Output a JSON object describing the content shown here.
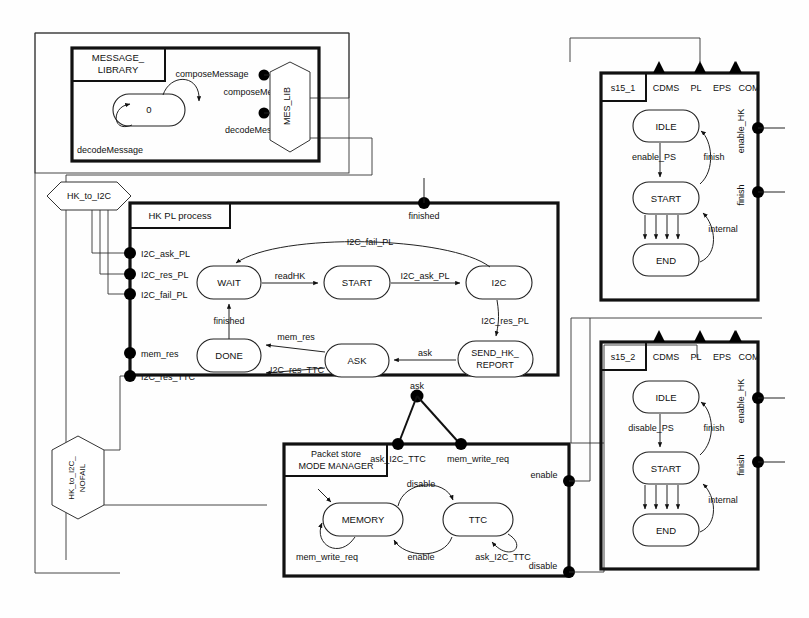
{
  "diagram": {
    "type": "state-machine",
    "colors": {
      "line": "#111111",
      "fill": "#ffffff",
      "node": "#000000"
    }
  },
  "message_library": {
    "block_title_line1": "MESSAGE_",
    "block_title_line2": "LIBRARY",
    "state": "0",
    "transitions": [
      {
        "label": "composeMessage",
        "kind": "self-loop-top"
      },
      {
        "label": "decodeMessage",
        "kind": "self-loop-bottom"
      }
    ],
    "port_labels": [
      "composeMessage",
      "decodeMessage"
    ],
    "gate": "MES_LIB"
  },
  "hk_pl_process": {
    "block_title": "HK PL process",
    "states": [
      "WAIT",
      "START",
      "I2C",
      "DONE",
      "ASK",
      "SEND_HK_\nREPORT"
    ],
    "state_labels": {
      "wait": "WAIT",
      "start": "START",
      "i2c": "I2C",
      "done": "DONE",
      "ask": "ASK",
      "send_hk_report_line1": "SEND_HK_",
      "send_hk_report_line2": "REPORT"
    },
    "transitions": [
      {
        "from": "WAIT",
        "to": "START",
        "label": "readHK"
      },
      {
        "from": "START",
        "to": "I2C",
        "label": "I2C_ask_PL"
      },
      {
        "from": "I2C",
        "to": "WAIT",
        "label": "I2C_fail_PL"
      },
      {
        "from": "I2C",
        "to": "SEND_HK_REPORT",
        "label": "I2C_res_PL"
      },
      {
        "from": "SEND_HK_REPORT",
        "to": "ASK",
        "label": "ask"
      },
      {
        "from": "ASK",
        "to": "DONE",
        "label": "mem_res"
      },
      {
        "from": "ASK",
        "to": "DONE",
        "label": "I2C_res_TTC"
      },
      {
        "from": "DONE",
        "to": "WAIT",
        "label": "finished"
      }
    ],
    "left_ports": [
      "I2C_ask_PL",
      "I2C_res_PL",
      "I2C_fail_PL",
      "mem_res",
      "I2C_res_TTC"
    ],
    "top_port": "finished",
    "bottom_port": "ask"
  },
  "packet_store": {
    "block_title_line1": "Packet store",
    "block_title_line2": "MODE MANAGER",
    "states": [
      "MEMORY",
      "TTC"
    ],
    "transitions": [
      {
        "from": "MEMORY",
        "to": "TTC",
        "label": "disable"
      },
      {
        "from": "TTC",
        "to": "MEMORY",
        "label": "enable"
      },
      {
        "from": "MEMORY",
        "to": "MEMORY",
        "label": "mem_write_req"
      },
      {
        "from": "TTC",
        "to": "TTC",
        "label": "ask_I2C_TTC"
      }
    ],
    "top_ports": [
      "ask_I2C_TTC",
      "mem_write_req"
    ],
    "right_ports": [
      "enable",
      "disable"
    ]
  },
  "s15_1": {
    "block_title": "s15_1",
    "header_ports": [
      "CDMS",
      "PL",
      "EPS",
      "COM"
    ],
    "states": [
      "IDLE",
      "START",
      "END"
    ],
    "transitions": [
      {
        "from": "IDLE",
        "to": "START",
        "label": "enable_PS"
      },
      {
        "from": "START",
        "to": "IDLE",
        "label": "finish"
      },
      {
        "from": "END",
        "to": "START",
        "label": "internal"
      }
    ],
    "right_ports": [
      "enable_HK",
      "finish"
    ]
  },
  "s15_2": {
    "block_title": "s15_2",
    "header_ports": [
      "CDMS",
      "PL",
      "EPS",
      "COM"
    ],
    "states": [
      "IDLE",
      "START",
      "END"
    ],
    "transitions": [
      {
        "from": "IDLE",
        "to": "START",
        "label": "disable_PS"
      },
      {
        "from": "START",
        "to": "IDLE",
        "label": "finish"
      },
      {
        "from": "END",
        "to": "START",
        "label": "internal"
      }
    ],
    "right_ports": [
      "enable_HK",
      "finish"
    ]
  },
  "gates": {
    "hk_to_i2c": "HK_to_I2C",
    "hk_to_i2c_nofail_line1": "HK_to_I2C_",
    "hk_to_i2c_nofail_line2": "NOFAIL",
    "mes_lib": "MES_LIB"
  }
}
